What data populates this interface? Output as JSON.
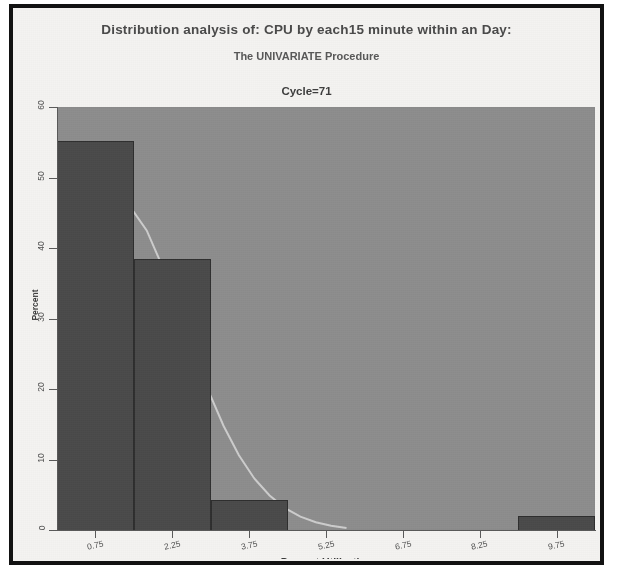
{
  "figure": {
    "title": "Distribution analysis of: CPU by each15 minute within an Day:",
    "subtitle": "The UNIVARIATE Procedure",
    "section_title": "Cycle=71"
  },
  "colors": {
    "plot_background": "#8d8d8d",
    "bar_fill": "#4a4a4a",
    "bar_outline": "#2e2e2e",
    "curve": "#d8d8d8",
    "page_background": "#f4f3f1",
    "border": "#121212",
    "axis": "#5a5a5a",
    "text": "#4a4a4a"
  },
  "chart_data": {
    "type": "bar",
    "title": "Distribution analysis of: CPU by each15 minute within an Day:",
    "subtitle": "The UNIVARIATE Procedure",
    "panel_label": "Cycle=71",
    "xlabel": "Percent Utilization",
    "ylabel": "Percent",
    "xtick_labels": [
      "0.75",
      "2.25",
      "3.75",
      "5.25",
      "6.75",
      "8.25",
      "9.75"
    ],
    "xtick_values": [
      0.75,
      2.25,
      3.75,
      5.25,
      6.75,
      8.25,
      9.75
    ],
    "ytick_labels": [
      "0",
      "10",
      "20",
      "30",
      "40",
      "50",
      "60"
    ],
    "ytick_values": [
      0,
      10,
      20,
      30,
      40,
      50,
      60
    ],
    "xlim": [
      0.0,
      10.5
    ],
    "ylim": [
      0,
      60
    ],
    "grid": false,
    "legend": false,
    "bin_width": 1.5,
    "categories": [
      "0.75",
      "2.25",
      "3.75",
      "9.75"
    ],
    "values": [
      55.2,
      38.5,
      4.2,
      2.0
    ],
    "bars": [
      {
        "bin_center": 0.75,
        "bin_start": 0.0,
        "bin_end": 1.5,
        "percent": 55.2
      },
      {
        "bin_center": 2.25,
        "bin_start": 1.5,
        "bin_end": 3.0,
        "percent": 38.5
      },
      {
        "bin_center": 3.75,
        "bin_start": 3.0,
        "bin_end": 4.5,
        "percent": 4.2
      },
      {
        "bin_center": 9.75,
        "bin_start": 9.0,
        "bin_end": 10.5,
        "percent": 2.0
      }
    ],
    "series": [
      {
        "name": "Normal density curve",
        "type": "line",
        "x": [
          0.25,
          0.55,
          0.85,
          1.15,
          1.45,
          1.75,
          2.05,
          2.35,
          2.65,
          2.95,
          3.25,
          3.55,
          3.85,
          4.15,
          4.45,
          4.75,
          5.05,
          5.35,
          5.65
        ],
        "y": [
          30.0,
          38.0,
          43.5,
          46.0,
          45.6,
          42.5,
          37.5,
          31.5,
          25.5,
          19.8,
          14.8,
          10.6,
          7.3,
          4.9,
          3.1,
          1.9,
          1.1,
          0.6,
          0.3
        ]
      }
    ]
  }
}
